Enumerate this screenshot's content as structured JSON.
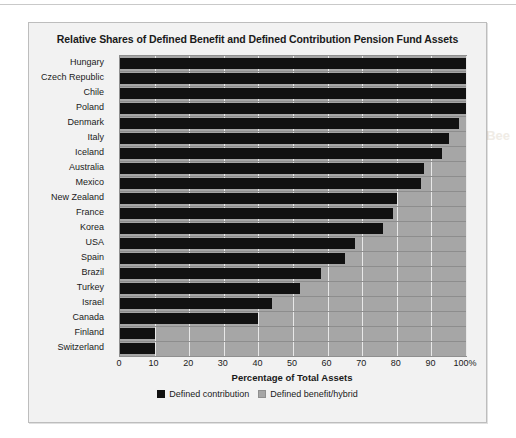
{
  "figure": {
    "title": "Relative Shares of Defined Benefit and Defined Contribution Pension Fund Assets"
  },
  "legend": {
    "items": [
      {
        "label": "Defined contribution",
        "color": "#111111",
        "key": "dc"
      },
      {
        "label": "Defined benefit/hybrid",
        "color": "#a6a6a6",
        "key": "db"
      }
    ]
  },
  "axis": {
    "x_title": "Percentage of Total Assets",
    "ticks": [
      "0",
      "10",
      "20",
      "30",
      "40",
      "50",
      "60",
      "70",
      "80",
      "90",
      "100%"
    ]
  },
  "colors": {
    "defined_contribution": "#111111",
    "defined_benefit": "#a6a6a6",
    "plot_border": "#8f8f8f",
    "gridline": "#e8e8e8",
    "figure_bg": "#f2f2f2",
    "figure_border": "#bdbdbd"
  },
  "ghost_text": {
    "a": "Bee",
    "b": "",
    "c": ""
  },
  "chart_data": {
    "type": "bar",
    "orientation": "horizontal",
    "stacked": true,
    "title": "Relative Shares of Defined Benefit and Defined Contribution Pension Fund Assets",
    "xlabel": "Percentage of Total Assets",
    "ylabel": "",
    "xlim": [
      0,
      100
    ],
    "xticks": [
      0,
      10,
      20,
      30,
      40,
      50,
      60,
      70,
      80,
      90,
      100
    ],
    "grid": true,
    "legend_position": "bottom",
    "categories": [
      "Hungary",
      "Czech Republic",
      "Chile",
      "Poland",
      "Denmark",
      "Italy",
      "Iceland",
      "Australia",
      "Mexico",
      "New Zealand",
      "France",
      "Korea",
      "USA",
      "Spain",
      "Brazil",
      "Turkey",
      "Israel",
      "Canada",
      "Finland",
      "Switzerland"
    ],
    "series": [
      {
        "name": "Defined contribution",
        "color": "#111111",
        "values": [
          100,
          100,
          100,
          100,
          98,
          95,
          93,
          88,
          87,
          80,
          79,
          76,
          68,
          65,
          58,
          52,
          44,
          40,
          10,
          10
        ]
      },
      {
        "name": "Defined benefit/hybrid",
        "color": "#a6a6a6",
        "values": [
          0,
          0,
          0,
          0,
          2,
          5,
          7,
          12,
          13,
          20,
          21,
          24,
          32,
          35,
          42,
          48,
          56,
          60,
          90,
          90
        ]
      }
    ]
  }
}
